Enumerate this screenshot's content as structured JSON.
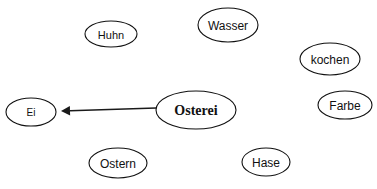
{
  "diagram": {
    "type": "semantic-network",
    "background_color": "#ffffff",
    "stroke_color": "#111111",
    "canvas": {
      "width": 377,
      "height": 189
    },
    "nodes": [
      {
        "id": "ei",
        "label": "Ei",
        "cx": 31,
        "cy": 112,
        "rx": 25,
        "ry": 14,
        "font_size": 10,
        "bold": false,
        "central": false
      },
      {
        "id": "huhn",
        "label": "Huhn",
        "cx": 111,
        "cy": 34,
        "rx": 26,
        "ry": 13,
        "font_size": 11,
        "bold": false,
        "central": false
      },
      {
        "id": "wasser",
        "label": "Wasser",
        "cx": 228,
        "cy": 25,
        "rx": 30,
        "ry": 17,
        "font_size": 12,
        "bold": false,
        "central": false
      },
      {
        "id": "kochen",
        "label": "kochen",
        "cx": 330,
        "cy": 59,
        "rx": 30,
        "ry": 16,
        "font_size": 12,
        "bold": false,
        "central": false
      },
      {
        "id": "farbe",
        "label": "Farbe",
        "cx": 345,
        "cy": 105,
        "rx": 27,
        "ry": 14,
        "font_size": 12,
        "bold": false,
        "central": false
      },
      {
        "id": "osterei",
        "label": "Osterei",
        "cx": 196,
        "cy": 110,
        "rx": 40,
        "ry": 19,
        "font_size": 14,
        "bold": true,
        "central": true
      },
      {
        "id": "ostern",
        "label": "Ostern",
        "cx": 118,
        "cy": 163,
        "rx": 29,
        "ry": 15,
        "font_size": 12,
        "bold": false,
        "central": false
      },
      {
        "id": "hase",
        "label": "Hase",
        "cx": 266,
        "cy": 162,
        "rx": 24,
        "ry": 14,
        "font_size": 12,
        "bold": false,
        "central": false
      }
    ],
    "edges": [
      {
        "id": "osterei-to-ei",
        "from": "osterei",
        "to": "ei",
        "directed": true,
        "x1": 156,
        "y1": 108,
        "x2": 61,
        "y2": 111,
        "arrowhead_size": 9
      }
    ]
  }
}
